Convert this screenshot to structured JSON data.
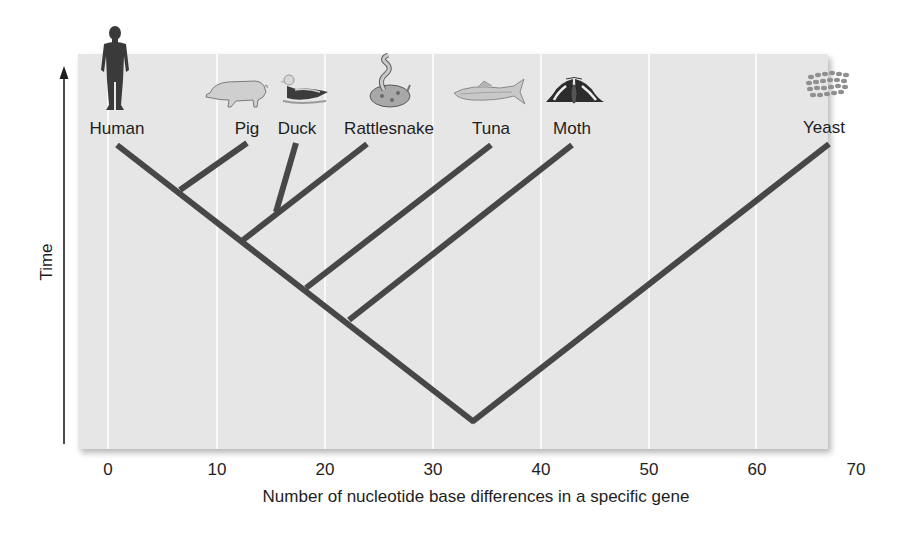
{
  "diagram": {
    "type": "phylogenetic-tree",
    "y_axis": {
      "label": "Time",
      "direction": "up-arrow"
    },
    "x_axis": {
      "label": "Number of nucleotide base differences in a specific gene",
      "ticks": [
        "0",
        "10",
        "20",
        "30",
        "40",
        "50",
        "60",
        "70"
      ],
      "range": [
        0,
        70
      ]
    },
    "taxa": [
      {
        "name": "Human",
        "icon": "human-icon",
        "approx_differences": 1
      },
      {
        "name": "Pig",
        "icon": "pig-icon",
        "approx_differences": 13
      },
      {
        "name": "Duck",
        "icon": "duck-icon",
        "approx_differences": 17
      },
      {
        "name": "Rattlesnake",
        "icon": "rattlesnake-icon",
        "approx_differences": 24
      },
      {
        "name": "Tuna",
        "icon": "tuna-icon",
        "approx_differences": 35
      },
      {
        "name": "Moth",
        "icon": "moth-icon",
        "approx_differences": 43
      },
      {
        "name": "Yeast",
        "icon": "yeast-icon",
        "approx_differences": 67
      }
    ],
    "colors": {
      "panel_background": "#e6e6e6",
      "gridline": "#ffffff",
      "branch": "#474747",
      "text": "#1e1e1e"
    }
  }
}
